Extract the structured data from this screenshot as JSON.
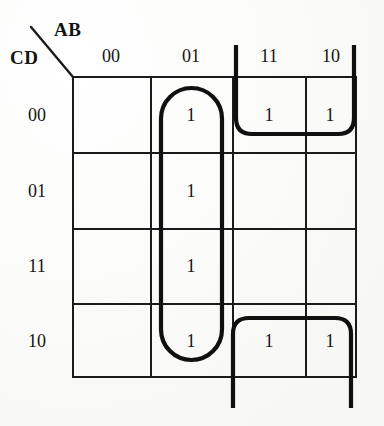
{
  "diagram": {
    "type": "karnaugh-map",
    "axis_labels": {
      "columns": "AB",
      "rows": "CD"
    },
    "column_headers": [
      "00",
      "01",
      "11",
      "10"
    ],
    "row_headers": [
      "00",
      "01",
      "11",
      "10"
    ],
    "cells": [
      {
        "row": "00",
        "col": "00",
        "value": ""
      },
      {
        "row": "00",
        "col": "01",
        "value": "1"
      },
      {
        "row": "00",
        "col": "11",
        "value": "1"
      },
      {
        "row": "00",
        "col": "10",
        "value": "1"
      },
      {
        "row": "01",
        "col": "00",
        "value": ""
      },
      {
        "row": "01",
        "col": "01",
        "value": "1"
      },
      {
        "row": "01",
        "col": "11",
        "value": ""
      },
      {
        "row": "01",
        "col": "10",
        "value": ""
      },
      {
        "row": "11",
        "col": "00",
        "value": ""
      },
      {
        "row": "11",
        "col": "01",
        "value": "1"
      },
      {
        "row": "11",
        "col": "11",
        "value": ""
      },
      {
        "row": "11",
        "col": "10",
        "value": ""
      },
      {
        "row": "10",
        "col": "00",
        "value": ""
      },
      {
        "row": "10",
        "col": "01",
        "value": "1"
      },
      {
        "row": "10",
        "col": "11",
        "value": "1"
      },
      {
        "row": "10",
        "col": "10",
        "value": "1"
      }
    ],
    "groups": [
      {
        "name": "column-01-group",
        "cells": [
          "00/01",
          "01/01",
          "11/01",
          "10/01"
        ],
        "wrap": false
      },
      {
        "name": "top-row-wrap-group",
        "cells": [
          "00/11",
          "00/10"
        ],
        "wrap": true
      },
      {
        "name": "bottom-row-wrap-group",
        "cells": [
          "10/11",
          "10/10"
        ],
        "wrap": true
      }
    ],
    "colors": {
      "background": "#fbfbf9",
      "grid_line": "#1b1b1b",
      "loop_line": "#101010",
      "text": "#141414"
    }
  }
}
